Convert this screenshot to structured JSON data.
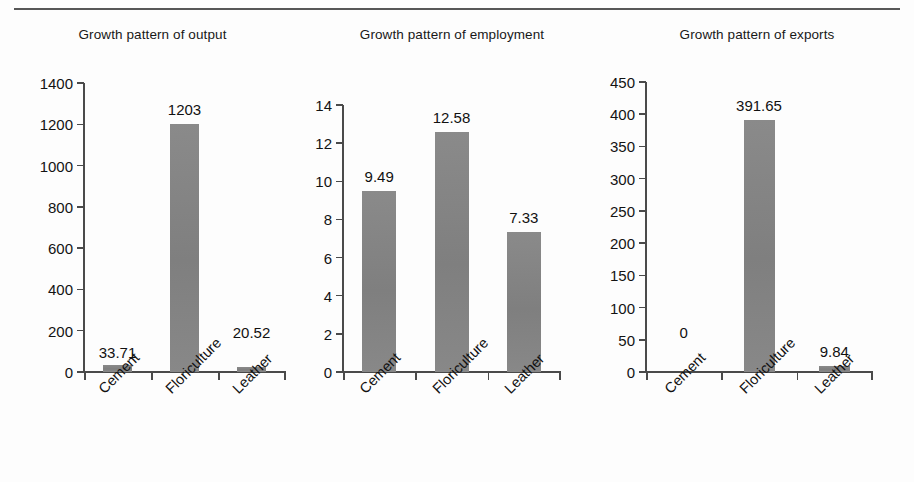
{
  "page": {
    "background": "#fdfdfd",
    "rule_color": "#3a3a3a",
    "bar_color": "#858585",
    "axis_color": "#4a4a4a",
    "text_color": "#111111"
  },
  "chart_data": [
    {
      "type": "bar",
      "title": "Growth pattern of output",
      "categories": [
        "Cement",
        "Floriculture",
        "Leather"
      ],
      "values": [
        33.71,
        1203,
        20.52
      ],
      "value_labels": [
        "33.71",
        "1203",
        "20.52"
      ],
      "xlabel": "",
      "ylabel": "",
      "ylim": [
        0,
        1400
      ],
      "yticks": [
        0,
        200,
        400,
        600,
        800,
        1000,
        1200,
        1400
      ],
      "ytick_labels": [
        "0",
        "200",
        "400",
        "600",
        "800",
        "1000",
        "1200",
        "1400"
      ],
      "grid": false,
      "legend": false
    },
    {
      "type": "bar",
      "title": "Growth pattern of employment",
      "categories": [
        "Cement",
        "Floriculture",
        "Leather"
      ],
      "values": [
        9.49,
        12.58,
        7.33
      ],
      "value_labels": [
        "9.49",
        "12.58",
        "7.33"
      ],
      "xlabel": "",
      "ylabel": "",
      "ylim": [
        0,
        14
      ],
      "yticks": [
        0,
        2,
        4,
        6,
        8,
        10,
        12,
        14
      ],
      "ytick_labels": [
        "0",
        "2",
        "4",
        "6",
        "8",
        "10",
        "12",
        "14"
      ],
      "grid": false,
      "legend": false
    },
    {
      "type": "bar",
      "title": "Growth pattern of exports",
      "categories": [
        "Cement",
        "Floriculture",
        "Leather"
      ],
      "values": [
        0,
        391.65,
        9.84
      ],
      "value_labels": [
        "0",
        "391.65",
        "9.84"
      ],
      "xlabel": "",
      "ylabel": "",
      "ylim": [
        0,
        450
      ],
      "yticks": [
        0,
        50,
        100,
        150,
        200,
        250,
        300,
        350,
        400,
        450
      ],
      "ytick_labels": [
        "0",
        "50",
        "100",
        "150",
        "200",
        "250",
        "300",
        "350",
        "400",
        "450"
      ],
      "grid": false,
      "legend": false
    }
  ]
}
